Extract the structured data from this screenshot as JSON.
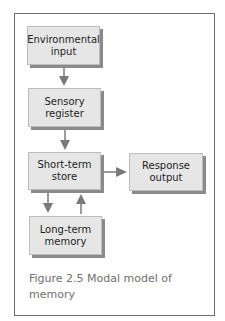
{
  "diagram": {
    "nodes": [
      {
        "id": "environmental-input",
        "label": "Environmental\ninput"
      },
      {
        "id": "sensory-register",
        "label": "Sensory\nregister"
      },
      {
        "id": "short-term-store",
        "label": "Short-term\nstore"
      },
      {
        "id": "response-output",
        "label": "Response\noutput"
      },
      {
        "id": "long-term-memory",
        "label": "Long-term\nmemory"
      }
    ],
    "edges": [
      {
        "from": "environmental-input",
        "to": "sensory-register"
      },
      {
        "from": "sensory-register",
        "to": "short-term-store"
      },
      {
        "from": "short-term-store",
        "to": "response-output"
      },
      {
        "from": "short-term-store",
        "to": "long-term-memory"
      },
      {
        "from": "long-term-memory",
        "to": "short-term-store"
      }
    ],
    "colors": {
      "box_fill": "#e6e6e6",
      "box_shadow": "#8a8a8a",
      "arrow": "#7a7a7a",
      "frame": "#6e6e6e",
      "caption": "#6f6f6f"
    }
  },
  "caption": "Figure 2.5  Modal model of\nmemory"
}
